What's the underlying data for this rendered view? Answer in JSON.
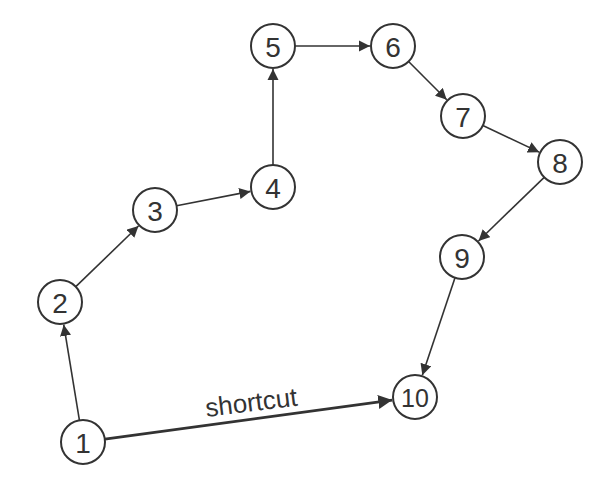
{
  "diagram": {
    "type": "directed-graph",
    "nodes": [
      {
        "id": "1",
        "label": "1",
        "x": 83,
        "y": 442
      },
      {
        "id": "2",
        "label": "2",
        "x": 60,
        "y": 302
      },
      {
        "id": "3",
        "label": "3",
        "x": 155,
        "y": 210
      },
      {
        "id": "4",
        "label": "4",
        "x": 273,
        "y": 187
      },
      {
        "id": "5",
        "label": "5",
        "x": 273,
        "y": 46
      },
      {
        "id": "6",
        "label": "6",
        "x": 393,
        "y": 46
      },
      {
        "id": "7",
        "label": "7",
        "x": 463,
        "y": 116
      },
      {
        "id": "8",
        "label": "8",
        "x": 560,
        "y": 162
      },
      {
        "id": "9",
        "label": "9",
        "x": 462,
        "y": 257
      },
      {
        "id": "10",
        "label": "10",
        "x": 415,
        "y": 397
      }
    ],
    "edges": [
      {
        "from": "1",
        "to": "2"
      },
      {
        "from": "2",
        "to": "3"
      },
      {
        "from": "3",
        "to": "4"
      },
      {
        "from": "4",
        "to": "5"
      },
      {
        "from": "5",
        "to": "6"
      },
      {
        "from": "6",
        "to": "7"
      },
      {
        "from": "7",
        "to": "8"
      },
      {
        "from": "8",
        "to": "9"
      },
      {
        "from": "9",
        "to": "10"
      },
      {
        "from": "1",
        "to": "10",
        "label": "shortcut",
        "thick": true
      }
    ],
    "shortcut_label": "shortcut"
  }
}
